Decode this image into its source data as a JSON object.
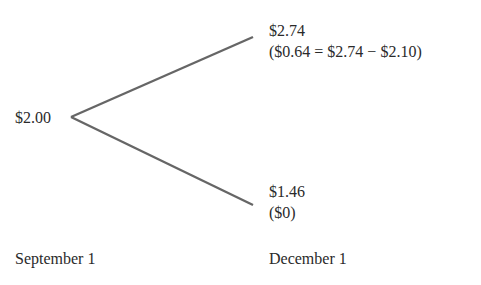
{
  "tree": {
    "root": {
      "label": "$2.00"
    },
    "up": {
      "price": "$2.74",
      "payoff": "($0.64 = $2.74 − $2.10)"
    },
    "down": {
      "price": "$1.46",
      "payoff": "($0)"
    },
    "time_labels": {
      "start": "September 1",
      "end": "December 1"
    },
    "line_color": "#666666"
  }
}
